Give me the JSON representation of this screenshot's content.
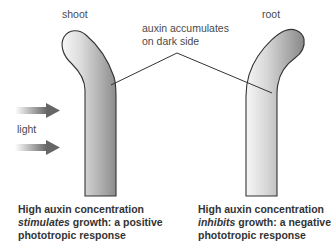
{
  "labels": {
    "shoot": "shoot",
    "root": "root",
    "auxin_line1": "auxin accumulates",
    "auxin_line2": "on dark side",
    "light": "light"
  },
  "captions": {
    "shoot": {
      "line1": "High auxin concentration",
      "line2_em": "stimulates",
      "line2_rest": " growth: a positive",
      "line3": "phototropic response"
    },
    "root": {
      "line1": "High auxin concentration",
      "line2_em": "inhibits",
      "line2_rest": " growth: a negative",
      "line3": "phototropic response"
    }
  },
  "colors": {
    "outline": "#333333",
    "gradient_light": "#f4f4f4",
    "gradient_dark": "#8a8a8a",
    "arrow_dark": "#6a6a6a",
    "arrow_light": "#ffffff"
  }
}
